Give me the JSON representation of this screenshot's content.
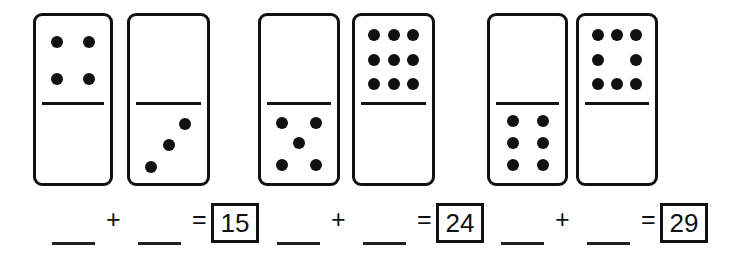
{
  "worksheet": {
    "title": "Domino addition worksheet",
    "ink_color": "#111111",
    "background_color": "#ffffff"
  },
  "dominoes": [
    {
      "id": "domino-1",
      "top_pips": 4,
      "bottom_pips": 0,
      "top_pattern": "four-corners",
      "bottom_pattern": "blank",
      "x": 33,
      "y": 13,
      "width": 80,
      "height": 173,
      "divider_y": 87
    },
    {
      "id": "domino-2",
      "top_pips": 0,
      "bottom_pips": 3,
      "top_pattern": "blank",
      "bottom_pattern": "diagonal-three",
      "x": 127,
      "y": 13,
      "width": 83,
      "height": 173,
      "divider_y": 87
    },
    {
      "id": "domino-3",
      "top_pips": 0,
      "bottom_pips": 5,
      "top_pattern": "blank",
      "bottom_pattern": "five-quincunx",
      "x": 258,
      "y": 13,
      "width": 82,
      "height": 173,
      "divider_y": 87
    },
    {
      "id": "domino-4",
      "top_pips": 9,
      "bottom_pips": 0,
      "top_pattern": "nine-grid",
      "bottom_pattern": "blank",
      "x": 352,
      "y": 13,
      "width": 83,
      "height": 173,
      "divider_y": 87
    },
    {
      "id": "domino-5",
      "top_pips": 0,
      "bottom_pips": 6,
      "top_pattern": "blank",
      "bottom_pattern": "six-two-by-three",
      "x": 487,
      "y": 13,
      "width": 81,
      "height": 173,
      "divider_y": 87
    },
    {
      "id": "domino-6",
      "top_pips": 8,
      "bottom_pips": 0,
      "top_pattern": "eight-three-two-three",
      "bottom_pattern": "blank",
      "x": 576,
      "y": 13,
      "width": 82,
      "height": 173,
      "divider_y": 87
    }
  ],
  "equations": [
    {
      "id": "equation-1",
      "plus_symbol": "+",
      "equals_symbol": "=",
      "answer": "15",
      "blank1_x": 52,
      "blank2_x": 138,
      "plus_x": 106,
      "equals_x": 192,
      "box_x": 211,
      "box_y": 203,
      "box_w": 48,
      "box_h": 40
    },
    {
      "id": "equation-2",
      "plus_symbol": "+",
      "equals_symbol": "=",
      "answer": "24",
      "blank1_x": 277,
      "blank2_x": 363,
      "plus_x": 331,
      "equals_x": 417,
      "box_x": 436,
      "box_y": 203,
      "box_w": 48,
      "box_h": 40
    },
    {
      "id": "equation-3",
      "plus_symbol": "+",
      "equals_symbol": "=",
      "answer": "29",
      "blank1_x": 501,
      "blank2_x": 587,
      "plus_x": 555,
      "equals_x": 641,
      "box_x": 660,
      "box_y": 203,
      "box_w": 48,
      "box_h": 40
    }
  ],
  "pip_patterns": {
    "blank": [],
    "four-corners": [
      [
        0.28,
        0.3
      ],
      [
        0.72,
        0.3
      ],
      [
        0.28,
        0.72
      ],
      [
        0.72,
        0.72
      ]
    ],
    "diagonal-three": [
      [
        0.72,
        0.26
      ],
      [
        0.5,
        0.52
      ],
      [
        0.27,
        0.8
      ]
    ],
    "five-quincunx": [
      [
        0.27,
        0.25
      ],
      [
        0.73,
        0.25
      ],
      [
        0.5,
        0.5
      ],
      [
        0.27,
        0.78
      ],
      [
        0.73,
        0.78
      ]
    ],
    "nine-grid": [
      [
        0.25,
        0.22
      ],
      [
        0.5,
        0.22
      ],
      [
        0.75,
        0.22
      ],
      [
        0.25,
        0.5
      ],
      [
        0.5,
        0.5
      ],
      [
        0.75,
        0.5
      ],
      [
        0.25,
        0.78
      ],
      [
        0.5,
        0.78
      ],
      [
        0.75,
        0.78
      ]
    ],
    "six-two-by-three": [
      [
        0.3,
        0.22
      ],
      [
        0.7,
        0.22
      ],
      [
        0.3,
        0.5
      ],
      [
        0.7,
        0.5
      ],
      [
        0.3,
        0.78
      ],
      [
        0.7,
        0.78
      ]
    ],
    "eight-three-two-three": [
      [
        0.25,
        0.22
      ],
      [
        0.5,
        0.22
      ],
      [
        0.75,
        0.22
      ],
      [
        0.25,
        0.5
      ],
      [
        0.75,
        0.5
      ],
      [
        0.25,
        0.78
      ],
      [
        0.5,
        0.78
      ],
      [
        0.75,
        0.78
      ]
    ]
  }
}
